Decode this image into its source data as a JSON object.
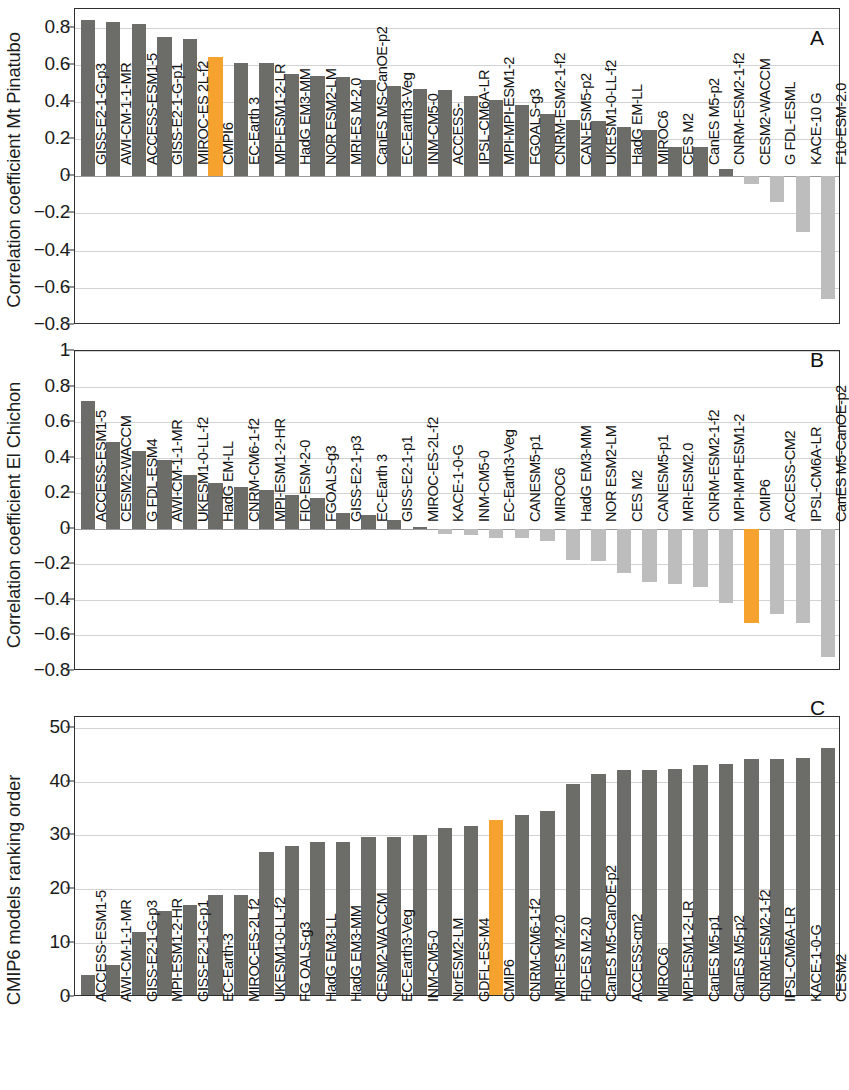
{
  "figure": {
    "colors": {
      "accent": "#f5a22e",
      "bar_dark": "#6c6c69",
      "bar_light": "#bdbdbd",
      "grid": "#d2d2d2",
      "axis": "#2f2f2f"
    },
    "highlight_series": "CMIP6"
  },
  "panels": [
    {
      "letter": "A",
      "ylabel": "Correlation coefficient Mt Pinatubo",
      "chart_data": {
        "type": "bar",
        "title": "",
        "xlabel": "",
        "ylabel": "Correlation coefficient Mt Pinatubo",
        "ylim": [
          -0.8,
          0.9
        ],
        "yticks": [
          0.8,
          0.6,
          0.4,
          0.2,
          0,
          -0.2,
          -0.4,
          -0.6,
          -0.8
        ],
        "ytick_labels": [
          "0.8",
          "0.6",
          "0.4",
          "0.2",
          "0",
          "−0.2",
          "−0.4",
          "−0.6",
          "−0.8"
        ],
        "grid": true,
        "legend": "none",
        "categories": [
          "GISS-E2-1-G-p3",
          "AWI-CM-1-1-MR",
          "ACCESS-ESM1-5",
          "GISS-E2-1-G-p1",
          "MIROC-ES 2L-f2",
          "CMPI6",
          "EC-Earth 3",
          "MPI-ESM1-2-LR",
          "HadG EM3-MM",
          "NOR ESM2-LM",
          "MRI-ES M-2.0",
          "CanES MS-CanOE-p2",
          "EC-Earth3-Veg",
          "INM-CM5-0",
          "ACCESS-",
          "IPSL-CM6A-LR",
          "MPI-MPI-ESM1-2",
          "FGOALS-g3",
          "CNRM-ESM2-1-f2",
          "CAN-ESM5-p2",
          "UKESM1-0-LL-f2",
          "HadG EM-LL",
          "MIROC6",
          "CES M2",
          "CanES M5-p2",
          "CNRM-ESM2-1-f2",
          "CESM2-WACCM",
          "G FDL-ESML",
          "KACE-10 G",
          "F10-ESM-2.0"
        ],
        "values": [
          0.84,
          0.83,
          0.82,
          0.75,
          0.74,
          0.64,
          0.61,
          0.61,
          0.55,
          0.54,
          0.535,
          0.52,
          0.485,
          0.47,
          0.465,
          0.43,
          0.41,
          0.385,
          0.335,
          0.305,
          0.3,
          0.265,
          0.25,
          0.16,
          0.155,
          0.04,
          -0.04,
          -0.14,
          -0.3,
          -0.66
        ],
        "bar_styles": [
          "dark",
          "dark",
          "dark",
          "dark",
          "dark",
          "accent",
          "dark",
          "dark",
          "dark",
          "dark",
          "dark",
          "dark",
          "dark",
          "dark",
          "dark",
          "dark",
          "dark",
          "dark",
          "dark",
          "dark",
          "dark",
          "dark",
          "dark",
          "dark",
          "dark",
          "dark",
          "light",
          "light",
          "light",
          "light"
        ]
      }
    },
    {
      "letter": "B",
      "ylabel": "Correlation coefficient El Chichon",
      "chart_data": {
        "type": "bar",
        "title": "",
        "xlabel": "",
        "ylabel": "Correlation coefficient El Chichon",
        "ylim": [
          -0.8,
          1.0
        ],
        "yticks": [
          1,
          0.8,
          0.6,
          0.4,
          0.2,
          0,
          -0.2,
          -0.4,
          -0.6,
          -0.8
        ],
        "ytick_labels": [
          "1",
          "0.8",
          "0.6",
          "0.4",
          "0.2",
          "0",
          "−0.2",
          "−0.4",
          "−0.6",
          "−0.8"
        ],
        "grid": true,
        "legend": "none",
        "categories": [
          "ACCESS-ESM1-5",
          "CESM2-WACCM",
          "G FDL-ESM4",
          "AWI-CM-1-1-MR",
          "UKESM1-0-LL-f2",
          "HadG EM-LL",
          "CNRM-CM6-1-f2",
          "MPI-ESM1-2-HR",
          "FIO-ESM-2-0",
          "FGOALS-g3",
          "GISS-E2-1-p3",
          "EC-Earth 3",
          "GISS-E2-1-p1",
          "MIROC-ES-2L-f2",
          "KACE-1-0-G",
          "INM-CM5-0",
          "EC-Earth3-Veg",
          "CANESM5-p1",
          "MIROC6",
          "HadG EM3-MM",
          "NOR ESM2-LM",
          "CES M2",
          "CANESM5-p1",
          "MRI-ESM2.0",
          "CNRM-ESM2-1-f2",
          "MPI-MPI-ESM1-2",
          "CMIP6",
          "ACCESS-CM2",
          "IPSL-CM6A-LR",
          "CanES M5-CanOE-p2"
        ],
        "values": [
          0.72,
          0.49,
          0.435,
          0.385,
          0.3,
          0.26,
          0.235,
          0.22,
          0.19,
          0.175,
          0.09,
          0.08,
          0.05,
          0.01,
          -0.03,
          -0.035,
          -0.05,
          -0.05,
          -0.07,
          -0.175,
          -0.18,
          -0.25,
          -0.3,
          -0.31,
          -0.33,
          -0.42,
          -0.53,
          -0.48,
          -0.53,
          -0.72
        ],
        "bar_styles": [
          "dark",
          "dark",
          "dark",
          "dark",
          "dark",
          "dark",
          "dark",
          "dark",
          "dark",
          "dark",
          "dark",
          "dark",
          "dark",
          "dark",
          "light",
          "light",
          "light",
          "light",
          "light",
          "light",
          "light",
          "light",
          "light",
          "light",
          "light",
          "light",
          "accent",
          "light",
          "light",
          "light"
        ]
      }
    },
    {
      "letter": "C",
      "ylabel": "CMIP6 models ranking order",
      "chart_data": {
        "type": "bar",
        "title": "",
        "xlabel": "",
        "ylabel": "CMIP6 models ranking order",
        "ylim": [
          0,
          52
        ],
        "yticks": [
          50,
          40,
          30,
          20,
          10,
          0
        ],
        "ytick_labels": [
          "50",
          "40",
          "30",
          "20",
          "10",
          "0"
        ],
        "grid": true,
        "legend": "none",
        "categories": [
          "ACCESS-ESM1-5",
          "AWI-CM-1-1-MR",
          "GISS-E2-1-G-p3",
          "MPI-ESM1-2-HR",
          "GISS-E2-1-G-p1",
          "EC-Earth-3",
          "MIROC-ES-2L f2",
          "UKESM1-0-LL-f2",
          "FG OALS-g3",
          "HadG EM3-LL",
          "HadG EM3-MM",
          "CESM2-WA CCM",
          "EC-Earth3-Veg",
          "INM-CM5-0",
          "NorESM2-LM",
          "GDFL-ES-M4",
          "CMIP6",
          "CNRM-CM6-1-f2",
          "MRI-ES M-2.0",
          "FIO-ES M-2.0",
          "CanES M5-CanOE-p2",
          "ACCESS-cm2",
          "MIROC6",
          "MPI-ESM1-2-LR",
          "CanES M5-p1",
          "CanES M5-p2",
          "CNRM-ESM2-1-f2",
          "IPSL-CM6A-LR",
          "KACE-1-0-G",
          "CESM2"
        ],
        "values": [
          4,
          6,
          12,
          16,
          17,
          19,
          19,
          27,
          28,
          28.8,
          28.8,
          29.8,
          29.8,
          30,
          31.3,
          31.8,
          32.8,
          33.8,
          34.5,
          39.5,
          41.5,
          42.2,
          42.2,
          42.3,
          43,
          43.3,
          44.2,
          44.2,
          44.3,
          46.3
        ],
        "bar_styles": [
          "dark",
          "dark",
          "dark",
          "dark",
          "dark",
          "dark",
          "dark",
          "dark",
          "dark",
          "dark",
          "dark",
          "dark",
          "dark",
          "dark",
          "dark",
          "dark",
          "accent",
          "dark",
          "dark",
          "dark",
          "dark",
          "dark",
          "dark",
          "dark",
          "dark",
          "dark",
          "dark",
          "dark",
          "dark",
          "dark"
        ]
      }
    }
  ]
}
